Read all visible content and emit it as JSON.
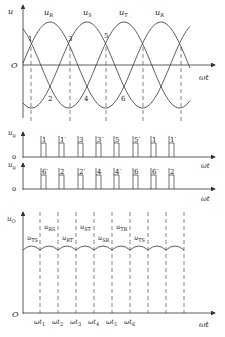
{
  "top_plot": {
    "y_axis_label": "u",
    "x_axis_label": "ωt",
    "origin_label": "O",
    "phase_labels": [
      {
        "base": "u",
        "sub": "R"
      },
      {
        "base": "u",
        "sub": "S"
      },
      {
        "base": "u",
        "sub": "T"
      },
      {
        "base": "u",
        "sub": "R"
      }
    ],
    "upper_crossing_labels": [
      "1",
      "3",
      "5"
    ],
    "lower_crossing_labels": [
      "2",
      "4",
      "6"
    ]
  },
  "pulse_plot_1": {
    "y_axis_label": {
      "base": "u",
      "sub": "g"
    },
    "zero_label": "o",
    "x_axis_label": "ωt",
    "pulse_labels": [
      "1",
      "1′",
      "3",
      "3′",
      "5",
      "5′",
      "1",
      "1′"
    ]
  },
  "pulse_plot_2": {
    "y_axis_label": {
      "base": "u",
      "sub": "g"
    },
    "zero_label": "o",
    "x_axis_label": "ωt",
    "pulse_labels": [
      "6′",
      "2",
      "2′",
      "4",
      "4′",
      "6",
      "6′",
      "2"
    ]
  },
  "output_plot": {
    "y_axis_label": {
      "base": "u",
      "sub": "O"
    },
    "origin_label": "O",
    "x_axis_label": "ωt",
    "segment_labels": [
      {
        "base": "u",
        "sub": "TS"
      },
      {
        "base": "u",
        "sub": "RS"
      },
      {
        "base": "u",
        "sub": "RT"
      },
      {
        "base": "u",
        "sub": "ST"
      },
      {
        "base": "u",
        "sub": "SR"
      },
      {
        "base": "u",
        "sub": "TR"
      },
      {
        "base": "u",
        "sub": "TS"
      }
    ],
    "time_ticks": [
      {
        "base": "ωt",
        "sub": "1"
      },
      {
        "base": "ωt",
        "sub": "2"
      },
      {
        "base": "ωt",
        "sub": "3"
      },
      {
        "base": "ωt",
        "sub": "4"
      },
      {
        "base": "ωt",
        "sub": "5"
      },
      {
        "base": "ωt",
        "sub": "6"
      }
    ]
  },
  "colors": {
    "stroke": "#333333",
    "background": "#ffffff"
  }
}
